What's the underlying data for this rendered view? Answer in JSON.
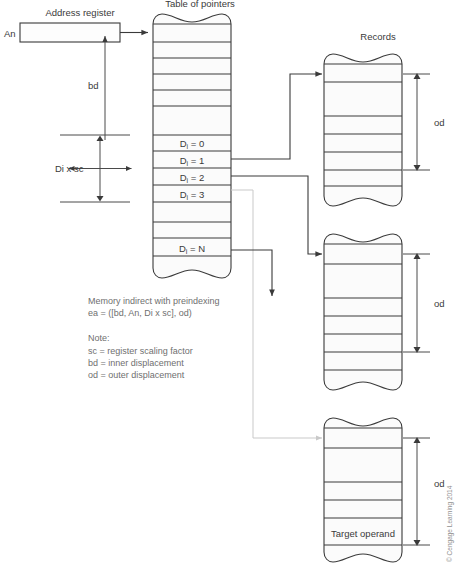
{
  "figure": {
    "caption_titles": {
      "address_register": "Address register",
      "table_of_pointers": "Table of pointers",
      "records": "Records"
    },
    "register": {
      "name": "An"
    },
    "dimensions": {
      "bd": "bd",
      "di_x_sc": "Di x sc",
      "od_top": "od",
      "od_middle": "od",
      "od_bottom": "od"
    },
    "pointer_rows": [
      {
        "prefix": "D",
        "subscript": "i",
        "suffix": "= 0"
      },
      {
        "prefix": "D",
        "subscript": "i",
        "suffix": "= 1"
      },
      {
        "prefix": "D",
        "subscript": "i",
        "suffix": "= 2"
      },
      {
        "prefix": "D",
        "subscript": "i",
        "suffix": "= 3"
      },
      {
        "prefix": "D",
        "subscript": "i",
        "suffix": "= N"
      }
    ],
    "target_operand": "Target operand",
    "notes": {
      "line1": "Memory indirect with preindexing",
      "line2": "ea = ([bd, An, Di x sc], od)",
      "line3": "Note:",
      "line4": "sc = register scaling factor",
      "line5": "bd = inner displacement",
      "line6": "od = outer displacement"
    },
    "copyright": "© Cengage Learning 2014",
    "colors": {
      "ink": "#3a3a3a",
      "faint_line": "#c9c9c9",
      "note_text": "#6f6f6f",
      "fill": "#fbfbfb",
      "background": "#ffffff"
    }
  }
}
